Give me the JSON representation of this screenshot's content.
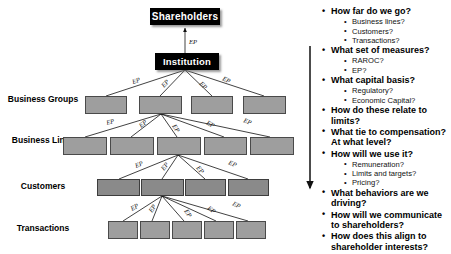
{
  "diagram": {
    "edge_label": "EP",
    "levels": [
      {
        "name": "shareholders",
        "row_label": "",
        "style": "dark",
        "nodes": [
          {
            "label": "Shareholders"
          }
        ]
      },
      {
        "name": "institution",
        "row_label": "",
        "style": "dark",
        "nodes": [
          {
            "label": "Institution"
          }
        ]
      },
      {
        "name": "business-groups",
        "row_label": "Business Groups",
        "style": "gray",
        "nodes": [
          {
            "label": ""
          },
          {
            "label": ""
          },
          {
            "label": ""
          },
          {
            "label": ""
          }
        ]
      },
      {
        "name": "business-lines",
        "row_label": "Business Lines",
        "style": "gray",
        "nodes": [
          {
            "label": ""
          },
          {
            "label": ""
          },
          {
            "label": ""
          },
          {
            "label": ""
          },
          {
            "label": ""
          }
        ]
      },
      {
        "name": "customers",
        "row_label": "Customers",
        "style": "graydark",
        "nodes": [
          {
            "label": ""
          },
          {
            "label": ""
          },
          {
            "label": ""
          },
          {
            "label": ""
          }
        ]
      },
      {
        "name": "transactions",
        "row_label": "Transactions",
        "style": "gray",
        "nodes": [
          {
            "label": ""
          },
          {
            "label": ""
          },
          {
            "label": ""
          },
          {
            "label": ""
          },
          {
            "label": ""
          }
        ]
      }
    ]
  },
  "panel": {
    "bullets": [
      {
        "text": "How far do we go?",
        "level": 1
      },
      {
        "text": "Business lines?",
        "level": 2
      },
      {
        "text": "Customers?",
        "level": 2
      },
      {
        "text": "Transactions?",
        "level": 2
      },
      {
        "text": "What set of measures?",
        "level": 1
      },
      {
        "text": "RAROC?",
        "level": 2
      },
      {
        "text": "EP?",
        "level": 2
      },
      {
        "text": "What capital basis?",
        "level": 1
      },
      {
        "text": "Regulatory?",
        "level": 2
      },
      {
        "text": "Economic Capital?",
        "level": 2
      },
      {
        "text": "How do these relate to limits?",
        "level": 1
      },
      {
        "text": "What tie to compensation?At what level?",
        "level": 1
      },
      {
        "text": "How will we use it?",
        "level": 1
      },
      {
        "text": "Remuneration?",
        "level": 2
      },
      {
        "text": "Limits and targets?",
        "level": 2
      },
      {
        "text": "Pricing?",
        "level": 2
      },
      {
        "text": "What behaviors are we driving?",
        "level": 1
      },
      {
        "text": "How will we communicate to shareholders?",
        "level": 1
      },
      {
        "text": "How does this align to shareholder interests?",
        "level": 1
      }
    ]
  },
  "colors": {
    "node_dark": "#000000",
    "node_gray": "#9e9e9e",
    "node_gray_dark": "#8a8a8a",
    "text": "#000000",
    "background": "#ffffff"
  }
}
